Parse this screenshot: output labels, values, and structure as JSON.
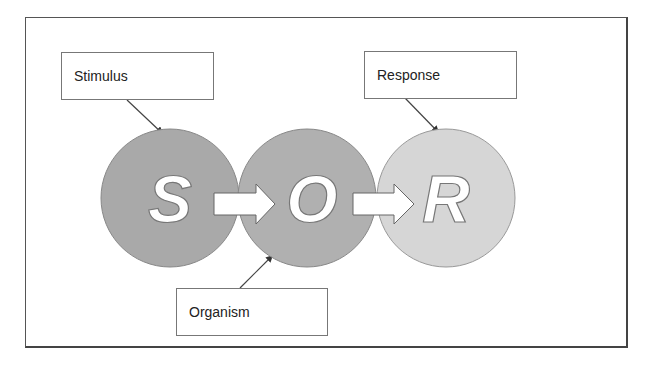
{
  "diagram": {
    "labels": {
      "stimulus": "Stimulus",
      "response": "Response",
      "organism": "Organism"
    },
    "nodes": [
      {
        "id": "S",
        "letter": "S",
        "fill": "#a9a9a9"
      },
      {
        "id": "O",
        "letter": "O",
        "fill": "#b0b0b0"
      },
      {
        "id": "R",
        "letter": "R",
        "fill": "#d6d6d6"
      }
    ],
    "colors": {
      "frame": "#555555",
      "arrow_fill": "#ffffff",
      "pointer": "#333333"
    }
  }
}
